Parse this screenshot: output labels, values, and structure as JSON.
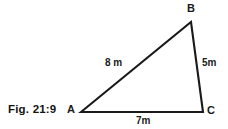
{
  "figure": {
    "caption": "Fig. 21:9",
    "background_color": "#ffffff",
    "stroke_color": "#1a1a1a",
    "text_color": "#1a1a1a"
  },
  "diagram": {
    "type": "triangle",
    "vertices": [
      {
        "name": "A",
        "label": "A",
        "x": 81,
        "y": 112
      },
      {
        "name": "B",
        "label": "B",
        "x": 191,
        "y": 22
      },
      {
        "name": "C",
        "label": "C",
        "x": 203,
        "y": 112
      }
    ],
    "sides": [
      {
        "name": "AB",
        "from": "A",
        "to": "B",
        "label": "8 m",
        "value": 8,
        "unit": "m"
      },
      {
        "name": "BC",
        "from": "B",
        "to": "C",
        "label": "5m",
        "value": 5,
        "unit": "m"
      },
      {
        "name": "AC",
        "from": "A",
        "to": "C",
        "label": "7m",
        "value": 7,
        "unit": "m"
      }
    ]
  }
}
